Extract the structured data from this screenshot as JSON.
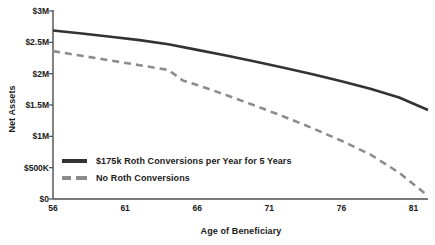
{
  "chart_data": {
    "type": "line",
    "title": "",
    "xlabel": "Age of Beneficiary",
    "ylabel": "Net Assets",
    "xlim": [
      56,
      82
    ],
    "ylim": [
      0,
      3000000
    ],
    "grid": false,
    "legend_position": "inside-bottom-left",
    "xticks": [
      56,
      61,
      66,
      71,
      76,
      81
    ],
    "xtick_labels": [
      "56",
      "61",
      "66",
      "71",
      "76",
      "81"
    ],
    "yticks": [
      0,
      500000,
      1000000,
      1500000,
      2000000,
      2500000,
      3000000
    ],
    "ytick_labels": [
      "$0",
      "$500K",
      "$1M",
      "$1.5M",
      "$2M",
      "$2.5M",
      "$3M"
    ],
    "series": [
      {
        "name": "$175k Roth Conversions per Year for 5 Years",
        "style": "solid",
        "color": "#333333",
        "width": 2.6,
        "x": [
          56,
          58,
          60,
          62,
          64,
          66,
          68,
          70,
          72,
          74,
          76,
          78,
          80,
          82
        ],
        "values": [
          2690000,
          2640000,
          2590000,
          2535000,
          2470000,
          2380000,
          2290000,
          2195000,
          2095000,
          1990000,
          1880000,
          1760000,
          1620000,
          1420000
        ]
      },
      {
        "name": "No Roth Conversions",
        "style": "dashed",
        "color": "#8c8c8c",
        "width": 2.6,
        "x": [
          56,
          58,
          60,
          62,
          64,
          65,
          66,
          68,
          70,
          72,
          74,
          76,
          78,
          80,
          82
        ],
        "values": [
          2360000,
          2285000,
          2210000,
          2135000,
          2060000,
          1890000,
          1820000,
          1660000,
          1490000,
          1315000,
          1130000,
          930000,
          710000,
          420000,
          50000
        ]
      }
    ]
  },
  "legend": {
    "items": [
      {
        "label": "$175k Roth Conversions per Year for 5 Years",
        "style": "solid"
      },
      {
        "label": "No Roth Conversions",
        "style": "dashed"
      }
    ]
  },
  "axes": {
    "y_title": "Net Assets",
    "x_title": "Age of Beneficiary"
  },
  "colors": {
    "solid_series": "#333333",
    "dashed_series": "#8c8c8c",
    "axis": "#4d4d4d",
    "text": "#1a1a1a",
    "background": "#ffffff"
  }
}
